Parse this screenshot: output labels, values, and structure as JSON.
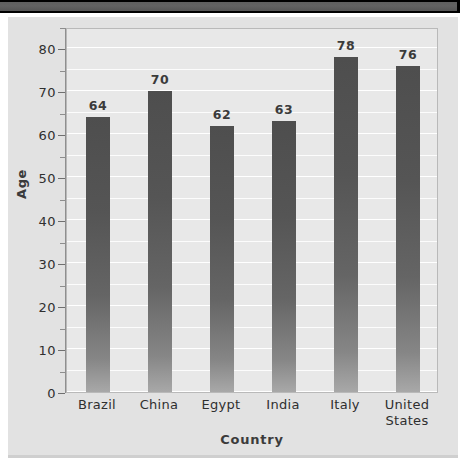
{
  "window": {
    "titlebar_color": "#5f5f5f"
  },
  "chart_data": {
    "type": "bar",
    "title": "",
    "subtitle": "",
    "xlabel": "Country",
    "ylabel": "Age",
    "categories": [
      "Brazil",
      "China",
      "Egypt",
      "India",
      "Italy",
      "United States"
    ],
    "values": [
      64,
      70,
      62,
      63,
      78,
      76
    ],
    "data_labels": [
      "64",
      "70",
      "62",
      "63",
      "78",
      "76"
    ],
    "ylim": [
      0,
      85
    ],
    "ytick_labels": [
      "0",
      "10",
      "20",
      "30",
      "40",
      "50",
      "60",
      "70",
      "80"
    ],
    "ytick_values": [
      0,
      10,
      20,
      30,
      40,
      50,
      60,
      70,
      80
    ],
    "minor_tick_step": 5,
    "grid": true,
    "grid_color": "#ffffff",
    "legend": false,
    "legend_position": "none",
    "bar_color": "#5a5a5a",
    "plot_background": "#e8e8e8",
    "figure_background": "#e2e2e2"
  }
}
